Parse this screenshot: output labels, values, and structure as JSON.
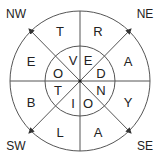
{
  "diagram": {
    "type": "compass-letter-wheel",
    "colors": {
      "line": "#333333",
      "text": "#222222",
      "background": "#ffffff"
    },
    "directions": [
      {
        "label": "NW",
        "x": 16,
        "y": 14
      },
      {
        "label": "NE",
        "x": 145,
        "y": 14
      },
      {
        "label": "SW",
        "x": 16,
        "y": 146
      },
      {
        "label": "SE",
        "x": 145,
        "y": 146
      }
    ],
    "outer_ring": [
      {
        "letter": "T",
        "x": 60,
        "y": 31
      },
      {
        "letter": "R",
        "x": 98,
        "y": 31
      },
      {
        "letter": "A",
        "x": 128,
        "y": 61
      },
      {
        "letter": "Y",
        "x": 128,
        "y": 102
      },
      {
        "letter": "A",
        "x": 98,
        "y": 132
      },
      {
        "letter": "L",
        "x": 60,
        "y": 132
      },
      {
        "letter": "B",
        "x": 31,
        "y": 102
      },
      {
        "letter": "E",
        "x": 31,
        "y": 61
      }
    ],
    "inner_ring": [
      {
        "letter": "V",
        "x": 73,
        "y": 60
      },
      {
        "letter": "E",
        "x": 88,
        "y": 60
      },
      {
        "letter": "D",
        "x": 101,
        "y": 73
      },
      {
        "letter": "N",
        "x": 101,
        "y": 90
      },
      {
        "letter": "O",
        "x": 88,
        "y": 103
      },
      {
        "letter": "I",
        "x": 73,
        "y": 103
      },
      {
        "letter": "T",
        "x": 58,
        "y": 90
      },
      {
        "letter": "O",
        "x": 58,
        "y": 73
      }
    ]
  }
}
